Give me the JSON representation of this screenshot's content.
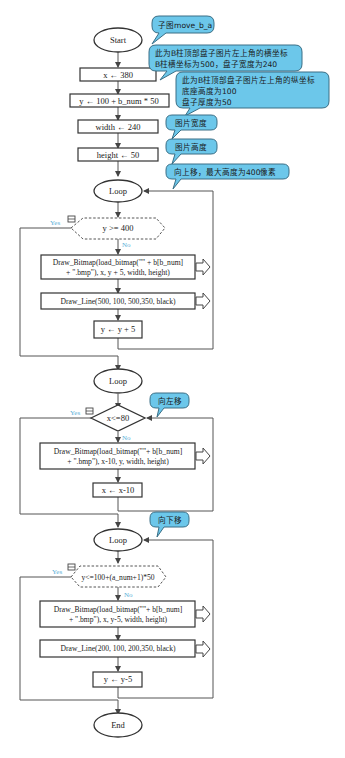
{
  "flowchart": {
    "start": "Start",
    "end": "End",
    "steps": {
      "x_init": "x ← 380",
      "y_init": "y ← 100 + b_num * 50",
      "width_init": "width ← 240",
      "height_init": "height ← 50"
    },
    "loop1": {
      "label": "Loop",
      "condition": "y >= 400",
      "yes": "Yes",
      "no": "No",
      "draw_bitmap_line1": "Draw_Bitmap(load_bitmap(\"\" + b[b_num]",
      "draw_bitmap_line2": "+ \".bmp\"), x, y + 5, width, height)",
      "draw_line": "Draw_Line(500, 100, 500,350, black)",
      "update": "y ← y + 5"
    },
    "loop2": {
      "label": "Loop",
      "condition": "x<=80",
      "yes": "Yes",
      "no": "No",
      "draw_bitmap_line1": "Draw_Bitmap(load_bitmap(\"\"+ b[b_num]",
      "draw_bitmap_line2": "+ \".bmp\"), x-10, y, width, height)",
      "update": "x ← x-10"
    },
    "loop3": {
      "label": "Loop",
      "condition": "y<=100+(a_num+1)*50",
      "yes": "Yes",
      "no": "No",
      "draw_bitmap_line1": "Draw_Bitmap(load_bitmap(\"\"+ b[b_num]",
      "draw_bitmap_line2": "+ \".bmp\"), x, y-5, width, height)",
      "draw_line": "Draw_Line(200, 100, 200,350, black)",
      "update": "y ← y-5"
    }
  },
  "notes": {
    "subgraph": "子图move_b_a",
    "x_note_line1": "此为B柱顶部盘子图片左上角的横坐标",
    "x_note_line2": "B柱横坐标为500，盘子宽度为240",
    "y_note_line1": "此为B柱顶部盘子图片左上角的纵坐标",
    "y_note_line2": "底座高度为100",
    "y_note_line3": "盘子厚度为50",
    "width_note": "图片宽度",
    "height_note": "图片高度",
    "up_note": "向上移，最大高度为400像素",
    "left_note": "向左移",
    "down_note": "向下移"
  },
  "colors": {
    "bubble_fill": "#6cc7ea",
    "bubble_stroke": "#3a6f86",
    "yes_no_label": "#5ab0d8",
    "shape_stroke": "#333333"
  }
}
